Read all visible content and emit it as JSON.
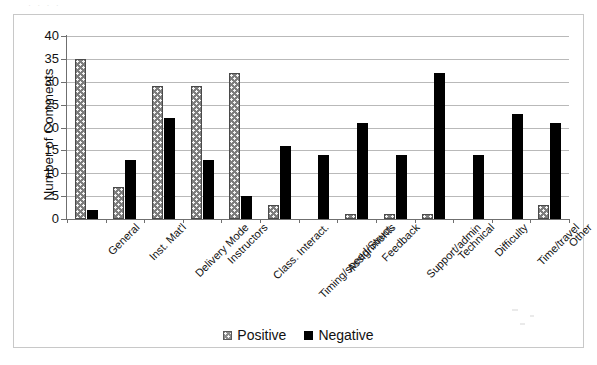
{
  "chart_data": {
    "type": "bar",
    "title": "",
    "xlabel": "",
    "ylabel": "Number of Comments",
    "ylim": [
      0,
      40
    ],
    "ytick_step": 5,
    "yticks": [
      0,
      5,
      10,
      15,
      20,
      25,
      30,
      35,
      40
    ],
    "grid": true,
    "legend_position": "bottom",
    "categories": [
      "General",
      "Inst. Mat'l",
      "Delivery Mode",
      "Instructors",
      "Class. Interact.",
      "Timing/speed/Struct.",
      "Assignments",
      "Feedback",
      "Support/admin",
      "Technical",
      "Difficulty",
      "Time/travel",
      "Other"
    ],
    "series": [
      {
        "name": "Positive",
        "color": "#7d7d7d",
        "pattern": "dotted",
        "values": [
          35,
          7,
          29,
          29,
          32,
          3,
          0,
          1,
          1,
          1,
          0,
          0,
          3
        ]
      },
      {
        "name": "Negative",
        "color": "#000000",
        "pattern": "solid",
        "values": [
          2,
          13,
          22,
          13,
          5,
          16,
          14,
          21,
          14,
          32,
          14,
          23,
          21
        ]
      }
    ]
  },
  "legend": {
    "items": [
      {
        "label": "Positive",
        "swatch": "positive"
      },
      {
        "label": "Negative",
        "swatch": "negative"
      }
    ]
  },
  "artifacts": {
    "top_strip_text": "·  ·   ·    ·"
  }
}
